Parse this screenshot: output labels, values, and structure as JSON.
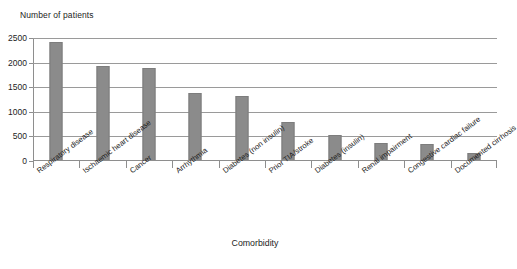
{
  "chart_data": {
    "type": "bar",
    "title": "",
    "ylabel": "Number of patients",
    "xlabel": "Comorbidity",
    "ylim": [
      0,
      2500
    ],
    "yticks": [
      0,
      500,
      1000,
      1500,
      2000,
      2500
    ],
    "ytick_labels": [
      "0",
      "500",
      "1000",
      "1500",
      "2000",
      "2500"
    ],
    "grid": true,
    "legend": "none",
    "bar_color": "#8b8b8b",
    "categories": [
      "Respiratory disease",
      "Ischaemic heart disease",
      "Cancer",
      "Arrhythmia",
      "Diabetes (non insulin)",
      "Prior TIA/stroke",
      "Diabetes (insulin)",
      "Renal impairment",
      "Congestive cardiac failure",
      "Documented cirrhosis"
    ],
    "values": [
      2420,
      1930,
      1900,
      1380,
      1330,
      790,
      530,
      370,
      355,
      165
    ]
  },
  "axis": {
    "y_title": "Number of patients",
    "x_title": "Comorbidity"
  }
}
